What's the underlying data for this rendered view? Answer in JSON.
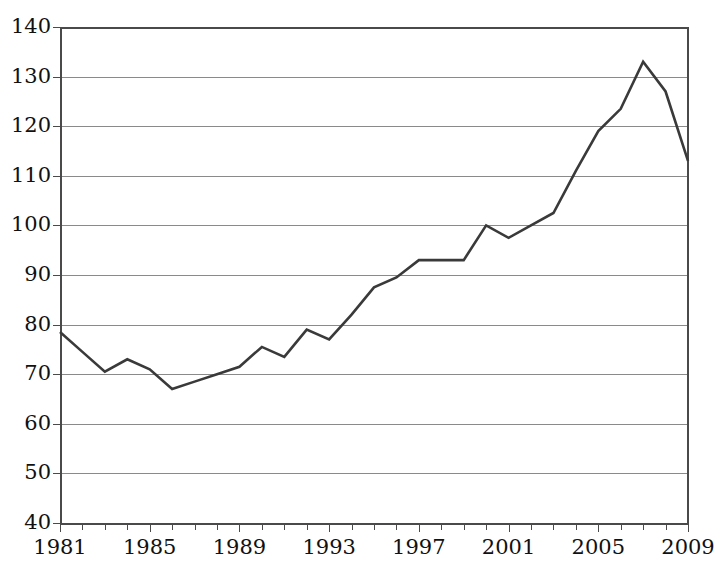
{
  "chart_data": {
    "type": "line",
    "title": "",
    "subtitle": "",
    "xlabel": "",
    "ylabel": "",
    "xlim": [
      1981,
      2009
    ],
    "ylim": [
      40,
      140
    ],
    "grid": true,
    "legend": false,
    "legend_position": "none",
    "line_color": "#3a3a3a",
    "grid_color": "#8a8a8a",
    "axis_color": "#4a4a4a",
    "y_ticks": [
      40,
      50,
      60,
      70,
      80,
      90,
      100,
      110,
      120,
      130,
      140
    ],
    "y_tick_labels": [
      "40",
      "50",
      "60",
      "70",
      "80",
      "90",
      "100",
      "110",
      "120",
      "130",
      "140"
    ],
    "x_tick_labels": [
      "1981",
      "1985",
      "1989",
      "1993",
      "1997",
      "2001",
      "2005",
      "2009"
    ],
    "x_tick_label_years": [
      1981,
      1985,
      1989,
      1993,
      1997,
      2001,
      2005,
      2009
    ],
    "x_minor_ticks_every": 1,
    "x": [
      1981,
      1982,
      1983,
      1984,
      1985,
      1986,
      1987,
      1988,
      1989,
      1990,
      1991,
      1992,
      1993,
      1994,
      1995,
      1996,
      1997,
      1998,
      1999,
      2000,
      2001,
      2002,
      2003,
      2004,
      2005,
      2006,
      2007,
      2008,
      2009
    ],
    "values": [
      78.5,
      74.5,
      70.5,
      73.0,
      71.0,
      67.0,
      68.5,
      70.0,
      71.5,
      75.5,
      73.5,
      79.0,
      77.0,
      82.0,
      87.5,
      89.5,
      93.0,
      93.0,
      93.0,
      100.0,
      97.5,
      100.0,
      102.5,
      111.0,
      119.0,
      123.5,
      133.0,
      127.0,
      113.0
    ],
    "series": [
      {
        "name": "series-1",
        "values": [
          78.5,
          74.5,
          70.5,
          73.0,
          71.0,
          67.0,
          68.5,
          70.0,
          71.5,
          75.5,
          73.5,
          79.0,
          77.0,
          82.0,
          87.5,
          89.5,
          93.0,
          93.0,
          93.0,
          100.0,
          97.5,
          100.0,
          102.5,
          111.0,
          119.0,
          123.5,
          133.0,
          127.0,
          113.0
        ]
      }
    ],
    "annotations": []
  },
  "plot_geometry": {
    "left": 60,
    "right": 688,
    "top": 27,
    "bottom": 523
  }
}
